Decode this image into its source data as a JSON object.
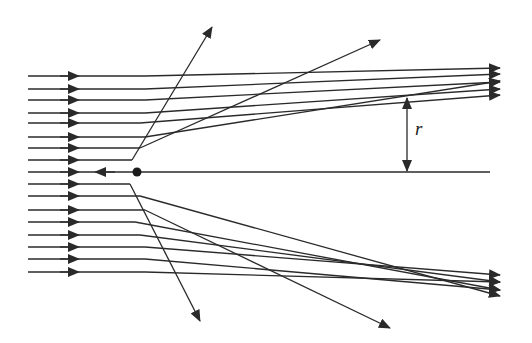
{
  "diagram": {
    "stroke_color": "#2a2a2a",
    "background": "#ffffff",
    "labels": {
      "impact_parameter": "r"
    },
    "scatterer": {
      "x": 137,
      "y": 172,
      "radius": 4.5
    },
    "axis": {
      "x1": 141,
      "y1": 172,
      "x2": 490,
      "y2": 172
    },
    "backscatter_ray": {
      "from": [
        28,
        172
      ],
      "arrow_in_x": 70,
      "turn_x": 133,
      "arrow_back_x": 100
    },
    "impact_marker": {
      "x": 407,
      "y_top": 97,
      "y_bottom": 172,
      "label_x": 415,
      "label_y": 128
    },
    "rays_top": [
      {
        "y": 76,
        "bend_x": 145,
        "end": [
          500,
          68
        ]
      },
      {
        "y": 89,
        "bend_x": 145,
        "end": [
          500,
          74
        ]
      },
      {
        "y": 100,
        "bend_x": 145,
        "end": [
          500,
          82
        ]
      },
      {
        "y": 113,
        "bend_x": 145,
        "end": [
          500,
          89
        ]
      },
      {
        "y": 123,
        "bend_x": 140,
        "end": [
          500,
          95
        ]
      },
      {
        "y": 137,
        "bend_x": 145,
        "end": [
          500,
          81
        ]
      },
      {
        "y": 148,
        "bend_x": 140,
        "end": [
          380,
          40
        ]
      },
      {
        "y": 160,
        "bend_x": 132,
        "end": [
          212,
          27
        ]
      }
    ],
    "rays_bottom": [
      {
        "y": 184,
        "bend_x": 130,
        "end": [
          200,
          321
        ]
      },
      {
        "y": 196,
        "bend_x": 140,
        "end": [
          500,
          296
        ]
      },
      {
        "y": 210,
        "bend_x": 145,
        "end": [
          390,
          328
        ]
      },
      {
        "y": 222,
        "bend_x": 135,
        "end": [
          500,
          290
        ]
      },
      {
        "y": 235,
        "bend_x": 140,
        "end": [
          500,
          282
        ]
      },
      {
        "y": 247,
        "bend_x": 145,
        "end": [
          500,
          275
        ]
      },
      {
        "y": 259,
        "bend_x": 145,
        "end": [
          500,
          290
        ]
      },
      {
        "y": 272,
        "bend_x": 145,
        "end": [
          500,
          282
        ]
      }
    ]
  }
}
